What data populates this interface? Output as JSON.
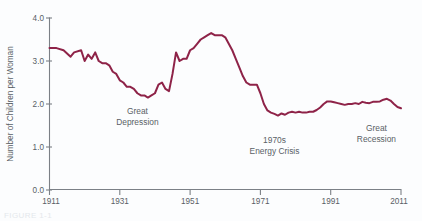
{
  "chart_data": {
    "type": "line",
    "title": "",
    "xlabel": "",
    "ylabel": "Number of Children per Woman",
    "xlim": [
      1911,
      2011
    ],
    "ylim": [
      0.0,
      4.0
    ],
    "grid": false,
    "legend": "none",
    "line_color": "#8e2348",
    "x_ticks": [
      "1911",
      "1931",
      "1951",
      "1971",
      "1991",
      "2011"
    ],
    "x_tick_values": [
      1911,
      1931,
      1951,
      1971,
      1991,
      2011
    ],
    "y_ticks": [
      "0.0",
      "1.0",
      "2.0",
      "3.0",
      "4.0"
    ],
    "y_tick_values": [
      0.0,
      1.0,
      2.0,
      3.0,
      4.0
    ],
    "series": [
      {
        "name": "Total Fertility Rate",
        "x": [
          1911,
          1913,
          1915,
          1917,
          1918,
          1920,
          1921,
          1922,
          1923,
          1924,
          1925,
          1926,
          1927,
          1928,
          1929,
          1930,
          1931,
          1932,
          1933,
          1934,
          1935,
          1936,
          1937,
          1938,
          1939,
          1940,
          1941,
          1942,
          1943,
          1944,
          1945,
          1946,
          1947,
          1948,
          1949,
          1950,
          1951,
          1952,
          1953,
          1954,
          1955,
          1956,
          1957,
          1958,
          1959,
          1960,
          1961,
          1962,
          1963,
          1964,
          1965,
          1966,
          1967,
          1968,
          1969,
          1970,
          1971,
          1972,
          1973,
          1974,
          1975,
          1976,
          1977,
          1978,
          1979,
          1980,
          1981,
          1982,
          1983,
          1984,
          1985,
          1986,
          1987,
          1988,
          1989,
          1990,
          1991,
          1992,
          1993,
          1994,
          1995,
          1996,
          1997,
          1998,
          1999,
          2000,
          2001,
          2002,
          2003,
          2004,
          2005,
          2006,
          2007,
          2008,
          2009,
          2010,
          2011
        ],
        "y": [
          3.3,
          3.3,
          3.25,
          3.1,
          3.2,
          3.25,
          3.0,
          3.15,
          3.05,
          3.2,
          3.0,
          2.95,
          2.95,
          2.9,
          2.75,
          2.7,
          2.55,
          2.5,
          2.4,
          2.4,
          2.35,
          2.25,
          2.2,
          2.2,
          2.15,
          2.2,
          2.25,
          2.45,
          2.5,
          2.35,
          2.3,
          2.7,
          3.2,
          3.0,
          3.05,
          3.05,
          3.25,
          3.3,
          3.4,
          3.5,
          3.55,
          3.6,
          3.65,
          3.6,
          3.6,
          3.6,
          3.55,
          3.4,
          3.25,
          3.05,
          2.85,
          2.65,
          2.5,
          2.45,
          2.45,
          2.45,
          2.25,
          2.0,
          1.85,
          1.8,
          1.77,
          1.73,
          1.78,
          1.75,
          1.8,
          1.82,
          1.8,
          1.82,
          1.8,
          1.8,
          1.82,
          1.82,
          1.86,
          1.92,
          2.0,
          2.06,
          2.06,
          2.04,
          2.02,
          2.0,
          1.98,
          2.0,
          2.0,
          2.02,
          2.0,
          2.05,
          2.03,
          2.02,
          2.05,
          2.05,
          2.06,
          2.1,
          2.12,
          2.08,
          2.0,
          1.93,
          1.9
        ]
      }
    ],
    "annotations": [
      {
        "id": "great-depression",
        "line1": "Great",
        "line2": "Depression",
        "x_year": 1936,
        "y_value": 1.78
      },
      {
        "id": "energy-crisis",
        "line1": "1970s",
        "line2": "Energy Crisis",
        "x_year": 1975,
        "y_value": 1.1
      },
      {
        "id": "great-recession",
        "line1": "Great",
        "line2": "Recession",
        "x_year": 2004,
        "y_value": 1.38
      }
    ]
  },
  "caption": {
    "text": "FIGURE 1-1"
  }
}
